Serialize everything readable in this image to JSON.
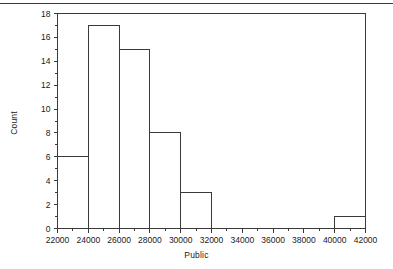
{
  "chart_data": {
    "type": "bar",
    "subtype": "histogram",
    "title": "",
    "xlabel": "Public",
    "ylabel": "Count",
    "xlim": [
      22000,
      42000
    ],
    "ylim": [
      0,
      18
    ],
    "bin_width": 2000,
    "grid": false,
    "legend": null,
    "x_major_ticks": [
      22000,
      24000,
      26000,
      28000,
      30000,
      32000,
      34000,
      36000,
      38000,
      40000,
      42000
    ],
    "x_tick_labels": [
      "22000",
      "24000",
      "26000",
      "28000",
      "30000",
      "32000",
      "34000",
      "36000",
      "38000",
      "40000",
      "42000"
    ],
    "x_minor_tick_step": 1000,
    "y_major_ticks": [
      0,
      2,
      4,
      6,
      8,
      10,
      12,
      14,
      16,
      18
    ],
    "y_tick_labels": [
      "0",
      "2",
      "4",
      "6",
      "8",
      "10",
      "12",
      "14",
      "16",
      "18"
    ],
    "y_minor_tick_step": 1,
    "bins": [
      {
        "start": 22000,
        "end": 24000,
        "count": 6
      },
      {
        "start": 24000,
        "end": 26000,
        "count": 17
      },
      {
        "start": 26000,
        "end": 28000,
        "count": 15
      },
      {
        "start": 28000,
        "end": 30000,
        "count": 8
      },
      {
        "start": 30000,
        "end": 32000,
        "count": 3
      },
      {
        "start": 32000,
        "end": 34000,
        "count": 0
      },
      {
        "start": 34000,
        "end": 36000,
        "count": 0
      },
      {
        "start": 36000,
        "end": 38000,
        "count": 0
      },
      {
        "start": 38000,
        "end": 40000,
        "count": 0
      },
      {
        "start": 40000,
        "end": 42000,
        "count": 1
      }
    ],
    "categories": [
      "22000-24000",
      "24000-26000",
      "26000-28000",
      "28000-30000",
      "30000-32000",
      "32000-34000",
      "34000-36000",
      "36000-38000",
      "38000-40000",
      "40000-42000"
    ],
    "values": [
      6,
      17,
      15,
      8,
      3,
      0,
      0,
      0,
      0,
      1
    ]
  },
  "style": {
    "line_color": "#3a3a3a",
    "bar_fill": "none",
    "bar_stroke": "#3a3a3a",
    "background": "#ffffff",
    "top_rule_color": "#3a3a3a"
  },
  "frame": {
    "has_top_border": true,
    "has_right_border": true,
    "has_top_page_rule": true
  }
}
